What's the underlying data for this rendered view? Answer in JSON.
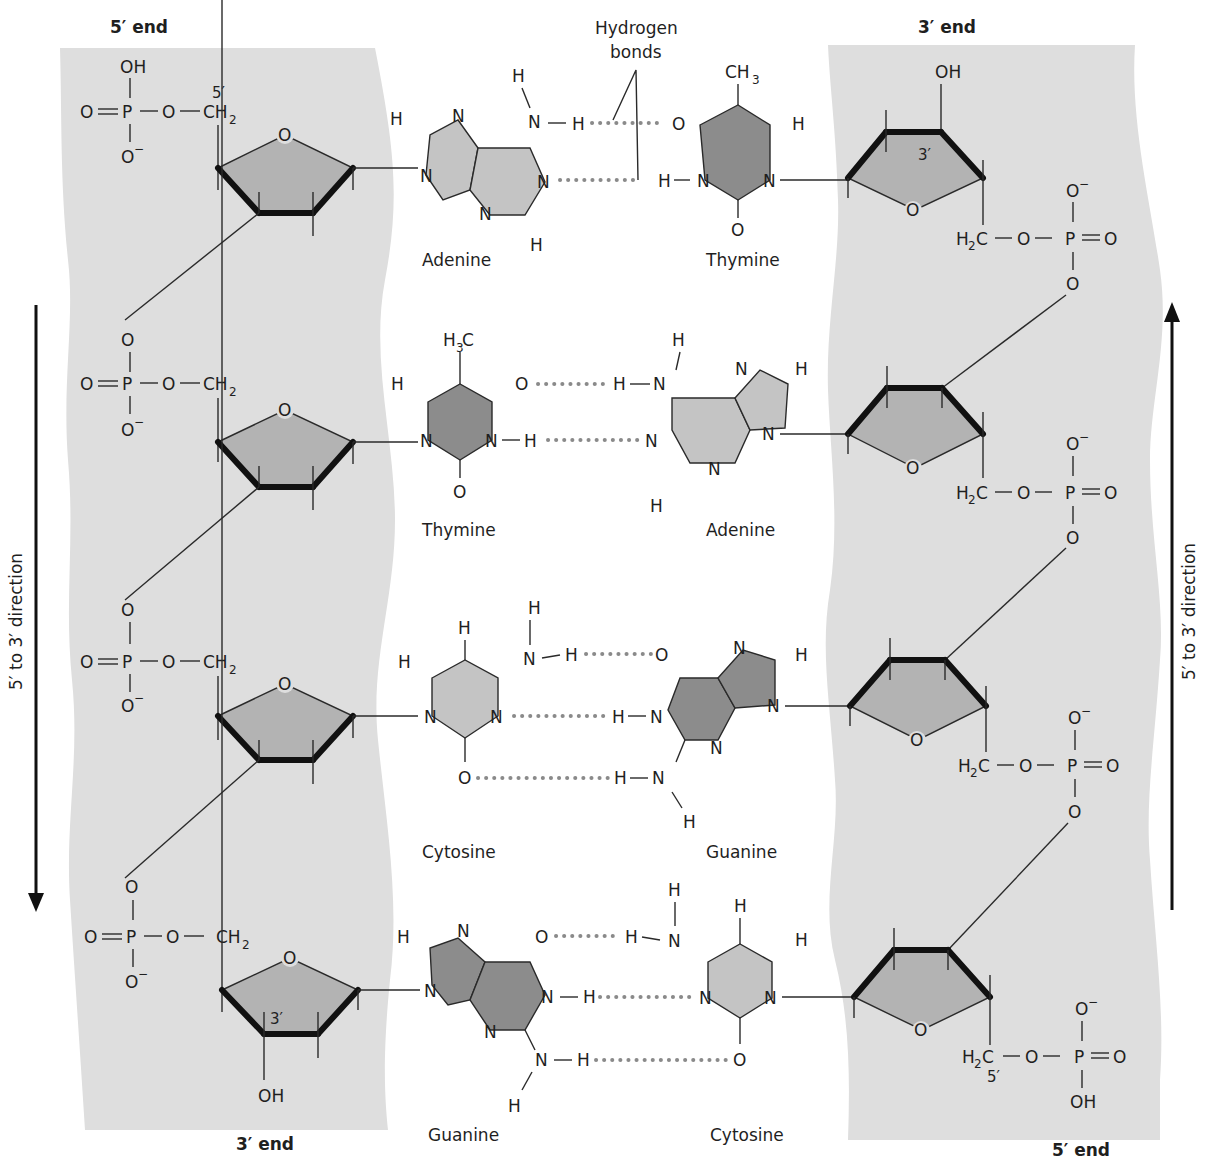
{
  "colors": {
    "backbone": "#dedede",
    "sugar": "#b3b3b3",
    "base_light": "#c4c4c4",
    "base_dark": "#8c8c8c",
    "hydrogen_bond": "#8a8a8a",
    "text": "#1f1f1f"
  },
  "left_strand": {
    "top_label": "5′ end",
    "bottom_label": "3′ end",
    "direction_label": "5′ to 3′ direction",
    "direction": "down",
    "top_prime": "5′",
    "bottom_prime": "3′"
  },
  "right_strand": {
    "top_label": "3′ end",
    "bottom_label": "5′ end",
    "direction_label": "5′ to 3′ direction",
    "direction": "up",
    "top_prime": "3′",
    "bottom_prime": "5′"
  },
  "callout": {
    "line1": "Hydrogen",
    "line2": "bonds"
  },
  "base_pairs": [
    {
      "left": "Adenine",
      "right": "Thymine",
      "h_bonds": 2
    },
    {
      "left": "Thymine",
      "right": "Adenine",
      "h_bonds": 2
    },
    {
      "left": "Cytosine",
      "right": "Guanine",
      "h_bonds": 3
    },
    {
      "left": "Guanine",
      "right": "Cytosine",
      "h_bonds": 3
    }
  ],
  "atoms": {
    "O": "O",
    "OH": "OH",
    "P": "P",
    "N": "N",
    "H": "H",
    "C": "C",
    "Ominus": "O",
    "minus": "−",
    "CH": "CH",
    "H2": "H",
    "sub2": "2",
    "sub3": "3"
  }
}
